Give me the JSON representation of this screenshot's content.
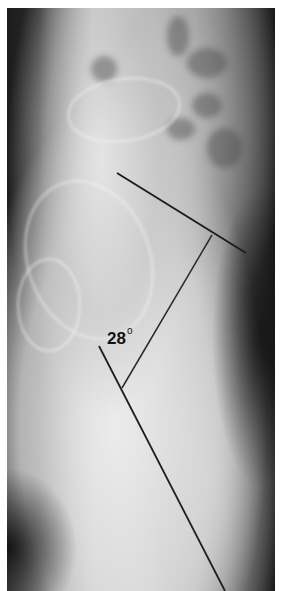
{
  "image": {
    "description": "Lateral radiograph of lumbosacral spine and pelvis with angle measurement lines",
    "colors": {
      "line": "#1e1e1e",
      "label": "#111111"
    }
  },
  "annotation": {
    "angle_value": "28",
    "angle_unit_symbol": "o"
  }
}
